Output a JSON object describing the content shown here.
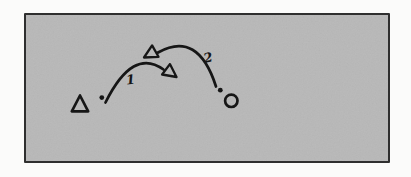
{
  "figure": {
    "type": "hand-drawn-sketch",
    "colors": {
      "page": "#fbfbfa",
      "border": "#2f2f2f",
      "panel": "#b8b8b8",
      "ink": "#161616"
    },
    "shapes": {
      "left_shape": "triangle",
      "right_shape": "circle"
    },
    "arrows": [
      {
        "label": "1",
        "from": "left-dot",
        "to": "center",
        "direction": "left-to-right-arc"
      },
      {
        "label": "2",
        "from": "right-dot",
        "to": "center",
        "direction": "right-to-left-arc"
      }
    ]
  }
}
